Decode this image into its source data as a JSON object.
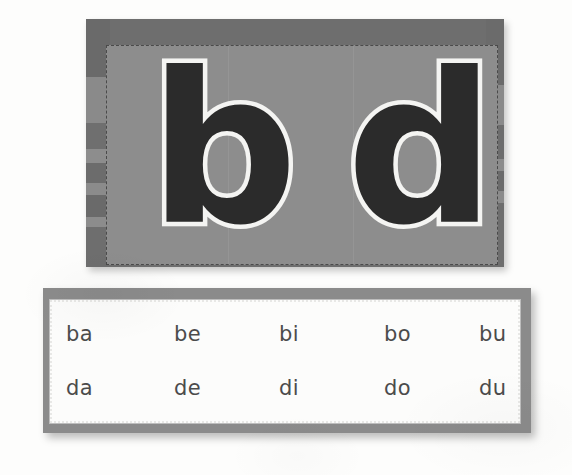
{
  "page": {
    "background_color": "#fdfdfc"
  },
  "letter_card": {
    "name": "letter-card",
    "frame_color": "#6e6e6e",
    "inner_color": "#8d8d8d",
    "border_style": "dashed",
    "border_color": "#4a4a4a",
    "letters": [
      {
        "glyph": "b",
        "fill_color": "#2b2b2b",
        "outline_color": "#f4f4f2"
      },
      {
        "glyph": "d",
        "fill_color": "#2b2b2b",
        "outline_color": "#f4f4f2"
      }
    ],
    "left_bands": [
      {
        "top": 0,
        "height": 58,
        "color": "#6a6a6a"
      },
      {
        "top": 58,
        "height": 46,
        "color": "#8a8a8a"
      },
      {
        "top": 104,
        "height": 26,
        "color": "#6f6f6f"
      },
      {
        "top": 130,
        "height": 14,
        "color": "#8d8d8d"
      },
      {
        "top": 144,
        "height": 20,
        "color": "#6c6c6c"
      },
      {
        "top": 164,
        "height": 12,
        "color": "#8b8b8b"
      },
      {
        "top": 176,
        "height": 22,
        "color": "#6a6a6a"
      },
      {
        "top": 198,
        "height": 10,
        "color": "#8c8c8c"
      },
      {
        "top": 208,
        "height": 40,
        "color": "#6e6e6e"
      }
    ],
    "right_bands": [
      {
        "top": 0,
        "height": 66,
        "color": "#6b6b6b"
      },
      {
        "top": 66,
        "height": 40,
        "color": "#8a8a8a"
      },
      {
        "top": 106,
        "height": 34,
        "color": "#6d6d6d"
      },
      {
        "top": 140,
        "height": 12,
        "color": "#8c8c8c"
      },
      {
        "top": 152,
        "height": 20,
        "color": "#6b6b6b"
      },
      {
        "top": 172,
        "height": 12,
        "color": "#8b8b8b"
      },
      {
        "top": 184,
        "height": 64,
        "color": "#6e6e6e"
      }
    ]
  },
  "syllable_card": {
    "name": "syllable-card",
    "frame_color": "#8b8b8b",
    "inner_color": "#fcfcfb",
    "border_style": "dotted",
    "text_color": "#4b4b4b",
    "rows": [
      {
        "label": "b-row",
        "cells": [
          "ba",
          "be",
          "bi",
          "bo",
          "bu"
        ]
      },
      {
        "label": "d-row",
        "cells": [
          "da",
          "de",
          "di",
          "do",
          "du"
        ]
      }
    ]
  }
}
